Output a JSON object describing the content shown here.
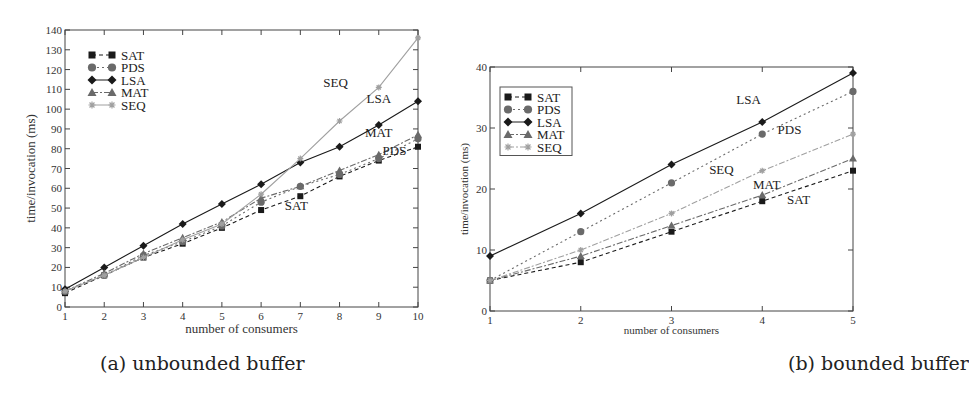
{
  "figure": {
    "caption_a": "(a) unbounded buffer",
    "caption_b": "(b) bounded buffer"
  },
  "chart_data": [
    {
      "type": "line",
      "title": "(a) unbounded buffer",
      "xlabel": "number of consumers",
      "ylabel": "time/invocation (ms)",
      "x": [
        1,
        2,
        3,
        4,
        5,
        6,
        7,
        8,
        9,
        10
      ],
      "xlim": [
        1,
        10
      ],
      "ylim": [
        0,
        140
      ],
      "yticks": [
        0,
        10,
        20,
        30,
        40,
        50,
        60,
        70,
        80,
        90,
        100,
        110,
        120,
        130,
        140
      ],
      "xticks": [
        1,
        2,
        3,
        4,
        5,
        6,
        7,
        8,
        9,
        10
      ],
      "grid": false,
      "legend_position": "upper left",
      "series": [
        {
          "name": "SAT",
          "marker": "square",
          "color": "#1a1a1a",
          "dash": "4,3",
          "values": [
            7,
            16,
            25,
            32,
            40,
            49,
            56,
            66,
            74,
            81
          ]
        },
        {
          "name": "PDS",
          "marker": "circle",
          "color": "#6a6a6a",
          "dash": "2,3",
          "values": [
            8,
            16,
            26,
            33,
            41,
            53,
            61,
            67,
            75,
            85
          ]
        },
        {
          "name": "LSA",
          "marker": "diamond",
          "color": "#1a1a1a",
          "dash": "",
          "values": [
            9,
            20,
            31,
            42,
            52,
            62,
            73,
            81,
            92,
            104
          ]
        },
        {
          "name": "MAT",
          "marker": "triangle",
          "color": "#6a6a6a",
          "dash": "6,2,2,2",
          "values": [
            8,
            17,
            27,
            35,
            43,
            55,
            61,
            69,
            77,
            87
          ]
        },
        {
          "name": "SEQ",
          "marker": "star",
          "color": "#a0a0a0",
          "dash": "",
          "values": [
            8,
            16,
            25,
            34,
            42,
            57,
            75,
            94,
            111,
            136
          ]
        }
      ],
      "annotations": [
        {
          "text": "SEQ",
          "x": 7.9,
          "y": 111
        },
        {
          "text": "LSA",
          "x": 9.0,
          "y": 103
        },
        {
          "text": "MAT",
          "x": 9.0,
          "y": 86
        },
        {
          "text": "PDS",
          "x": 9.4,
          "y": 77
        },
        {
          "text": "SAT",
          "x": 6.9,
          "y": 49
        }
      ]
    },
    {
      "type": "line",
      "title": "(b) bounded buffer",
      "xlabel": "number of consumers",
      "ylabel": "time/invocation (ms)",
      "x": [
        1,
        2,
        3,
        4,
        5
      ],
      "xlim": [
        1,
        5
      ],
      "ylim": [
        0,
        40
      ],
      "yticks": [
        0,
        10,
        20,
        30,
        40
      ],
      "xticks": [
        1,
        2,
        3,
        4,
        5
      ],
      "grid": false,
      "legend_position": "upper left",
      "series": [
        {
          "name": "SAT",
          "marker": "square",
          "color": "#1a1a1a",
          "dash": "4,3",
          "values": [
            5,
            8,
            13,
            18,
            23
          ]
        },
        {
          "name": "PDS",
          "marker": "circle",
          "color": "#6a6a6a",
          "dash": "2,3",
          "values": [
            5,
            13,
            21,
            29,
            36
          ]
        },
        {
          "name": "LSA",
          "marker": "diamond",
          "color": "#1a1a1a",
          "dash": "",
          "values": [
            9,
            16,
            24,
            31,
            39
          ]
        },
        {
          "name": "MAT",
          "marker": "triangle",
          "color": "#6a6a6a",
          "dash": "6,2,2,2",
          "values": [
            5,
            9,
            14,
            19,
            25
          ]
        },
        {
          "name": "SEQ",
          "marker": "star",
          "color": "#a0a0a0",
          "dash": "6,2,2,2",
          "values": [
            5,
            10,
            16,
            23,
            29
          ]
        }
      ],
      "annotations": [
        {
          "text": "LSA",
          "x": 3.85,
          "y": 34
        },
        {
          "text": "PDS",
          "x": 4.3,
          "y": 29
        },
        {
          "text": "SEQ",
          "x": 3.55,
          "y": 22.5
        },
        {
          "text": "MAT",
          "x": 4.05,
          "y": 20
        },
        {
          "text": "SAT",
          "x": 4.4,
          "y": 17.5
        }
      ]
    }
  ]
}
